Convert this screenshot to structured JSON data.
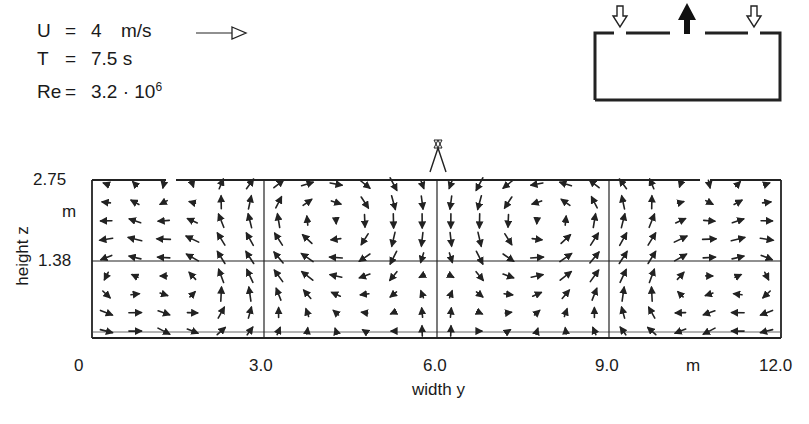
{
  "parameters": [
    {
      "symbol": "U",
      "eq": "=",
      "value": "4",
      "unit": "m/s"
    },
    {
      "symbol": "T",
      "eq": "=",
      "value": "7.5 s",
      "unit": ""
    },
    {
      "symbol": "Re",
      "eq": "=",
      "value": "3.2 · 10",
      "sup": "6"
    }
  ],
  "schematic": {
    "description": "Room cross-section with two inflow openings (hollow down arrows) and one central outflow (solid up arrow)",
    "inflow_arrow": "hollow-down-arrow",
    "outflow_arrow": "solid-up-arrow"
  },
  "chart_data": {
    "type": "vector-field",
    "title": "",
    "xlabel": "width y",
    "ylabel": "height z",
    "x_ticks": [
      "0",
      "3.0",
      "6.0",
      "9.0",
      "m",
      "12.0"
    ],
    "y_ticks": [
      "2.75",
      "m",
      "1.38"
    ],
    "xlim": [
      0,
      12.0
    ],
    "ylim": [
      0,
      2.75
    ],
    "grid": {
      "vertical": [
        3.0,
        6.0,
        9.0
      ],
      "horizontal": [
        1.38
      ]
    },
    "features": [
      {
        "type": "inlet-jet",
        "y": 1.5,
        "direction": "down",
        "description": "left inflow jet descending from ceiling slot"
      },
      {
        "type": "inlet-jet",
        "y": 10.5,
        "direction": "down",
        "description": "right inflow jet descending from ceiling slot"
      },
      {
        "type": "outlet-plume",
        "y": 6.0,
        "direction": "up",
        "description": "central upward plume to exhaust"
      },
      {
        "type": "vortex",
        "center": [
          0.75,
          1.0
        ],
        "rotation": "counter-clockwise"
      },
      {
        "type": "vortex",
        "center": [
          4.3,
          2.0
        ],
        "rotation": "clockwise"
      },
      {
        "type": "vortex",
        "center": [
          7.7,
          2.0
        ],
        "rotation": "counter-clockwise"
      },
      {
        "type": "vortex",
        "center": [
          11.25,
          1.0
        ],
        "rotation": "clockwise"
      }
    ]
  }
}
